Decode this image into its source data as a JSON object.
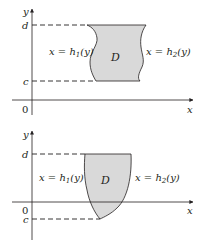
{
  "colors": {
    "region_fill": "#d9d9d9",
    "stroke": "#231f20",
    "background": "#ffffff"
  },
  "diagrams": [
    {
      "name": "type-II-region-top",
      "axis_labels": {
        "x": "x",
        "y": "y",
        "origin": "0"
      },
      "bound_labels": {
        "upper": "d",
        "lower": "c"
      },
      "region_label": "D",
      "left_curve": {
        "lhs": "x = h",
        "sub": "1",
        "rhs": "(y)"
      },
      "right_curve": {
        "lhs": "x = h",
        "sub": "2",
        "rhs": "(y)"
      }
    },
    {
      "name": "type-II-region-bottom",
      "axis_labels": {
        "x": "x",
        "y": "y",
        "origin": "0"
      },
      "bound_labels": {
        "upper": "d",
        "lower": "c"
      },
      "region_label": "D",
      "left_curve": {
        "lhs": "x = h",
        "sub": "1",
        "rhs": "(y)"
      },
      "right_curve": {
        "lhs": "x = h",
        "sub": "2",
        "rhs": "(y)"
      }
    }
  ]
}
